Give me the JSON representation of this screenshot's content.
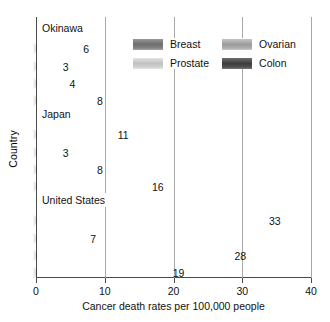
{
  "chart_data": {
    "type": "bar",
    "orientation": "horizontal",
    "title": "",
    "xlabel": "Cancer death rates per 100,000 people",
    "ylabel": "Country",
    "xlim": [
      0,
      40
    ],
    "xticks": [
      0,
      10,
      20,
      30,
      40
    ],
    "xtick_labels": [
      "0",
      "10",
      "20",
      "30",
      "40"
    ],
    "grid": true,
    "grid_axis": "x",
    "legend_position": "upper center inside",
    "categories": [
      "Okinawa",
      "Japan",
      "United States"
    ],
    "series": [
      {
        "name": "Breast",
        "color": "#7d7d7d",
        "values": [
          6,
          11,
          33
        ]
      },
      {
        "name": "Prostate",
        "color": "#cccccc",
        "values": [
          3,
          3,
          7
        ]
      },
      {
        "name": "Ovarian",
        "color": "#a6a6a6",
        "values": [
          4,
          8,
          28
        ]
      },
      {
        "name": "Colon",
        "color": "#464646",
        "values": [
          8,
          16,
          19
        ]
      }
    ],
    "bar_labels": {
      "Okinawa": {
        "Breast": "6",
        "Prostate": "3",
        "Ovarian": "4",
        "Colon": "8"
      },
      "Japan": {
        "Breast": "11",
        "Prostate": "3",
        "Ovarian": "8",
        "Colon": "16"
      },
      "United States": {
        "Breast": "33",
        "Prostate": "7",
        "Ovarian": "28",
        "Colon": "19"
      }
    }
  },
  "axes": {
    "y_title": "Country",
    "x_title": "Cancer death rates per 100,000 people",
    "x_ticks": [
      {
        "value": 0,
        "label": "0"
      },
      {
        "value": 10,
        "label": "10"
      },
      {
        "value": 20,
        "label": "20"
      },
      {
        "value": 30,
        "label": "30"
      },
      {
        "value": 40,
        "label": "40"
      }
    ]
  },
  "legend": {
    "items": [
      {
        "label": "Breast",
        "swatch": "breast-swatch"
      },
      {
        "label": "Ovarian",
        "swatch": "ovarian-swatch"
      },
      {
        "label": "Prostate",
        "swatch": "prostate-swatch"
      },
      {
        "label": "Colon",
        "swatch": "colon-swatch"
      }
    ]
  },
  "groups": [
    {
      "label": "Okinawa",
      "bars": [
        {
          "series": "Breast",
          "value": 6,
          "label": "6"
        },
        {
          "series": "Prostate",
          "value": 3,
          "label": "3"
        },
        {
          "series": "Ovarian",
          "value": 4,
          "label": "4"
        },
        {
          "series": "Colon",
          "value": 8,
          "label": "8"
        }
      ]
    },
    {
      "label": "Japan",
      "bars": [
        {
          "series": "Breast",
          "value": 11,
          "label": "11"
        },
        {
          "series": "Prostate",
          "value": 3,
          "label": "3"
        },
        {
          "series": "Ovarian",
          "value": 8,
          "label": "8"
        },
        {
          "series": "Colon",
          "value": 16,
          "label": "16"
        }
      ]
    },
    {
      "label": "United States",
      "bars": [
        {
          "series": "Breast",
          "value": 33,
          "label": "33"
        },
        {
          "series": "Prostate",
          "value": 7,
          "label": "7"
        },
        {
          "series": "Ovarian",
          "value": 28,
          "label": "28"
        },
        {
          "series": "Colon",
          "value": 19,
          "label": "19"
        }
      ]
    }
  ]
}
